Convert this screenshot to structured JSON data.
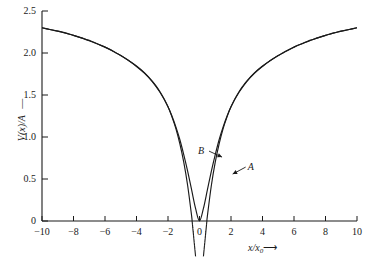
{
  "chart_data": {
    "type": "line",
    "title": "",
    "subtitle": "",
    "xlabel": "x/x0",
    "xlabel_display": "x/x",
    "xlabel_sub": "0",
    "xlabel_arrow": "⟶",
    "ylabel": "V(x)/A",
    "ylabel_arrow": "↑",
    "xlim": [
      -10,
      10
    ],
    "ylim": [
      0,
      2.5
    ],
    "xticks": [
      -10,
      -8,
      -6,
      -4,
      -2,
      0,
      2,
      4,
      6,
      8,
      10
    ],
    "xtick_labels": [
      "−10",
      "−8",
      "−6",
      "−4",
      "−2",
      "0",
      "2",
      "4",
      "6",
      "8",
      "10"
    ],
    "yticks": [
      0,
      0.5,
      1.0,
      1.5,
      2.0,
      2.5
    ],
    "ytick_labels": [
      "0",
      "0.5",
      "1.0",
      "1.5",
      "2.0",
      "2.5"
    ],
    "grid": false,
    "legend_position": "inline-annotations",
    "line_color": "#1a1a1a",
    "series": [
      {
        "name": "A",
        "label": "A",
        "style": "solid-with-dashed-extension",
        "annotation_x": 2.55,
        "annotation_y": 0.63,
        "description": "steep potential, crosses zero near x/x0 = ±1, dashed continuation below axis",
        "x": [
          -10,
          -9.5,
          -9,
          -8.5,
          -8,
          -7.5,
          -7,
          -6.5,
          -6,
          -5.5,
          -5,
          -4.5,
          -4,
          -3.5,
          -3,
          -2.5,
          -2,
          -1.75,
          -1.5,
          -1.25,
          -1,
          -0.75,
          -0.5,
          -0.25,
          0,
          0.25,
          0.5,
          0.75,
          1,
          1.25,
          1.5,
          1.75,
          2,
          2.5,
          3,
          3.5,
          4,
          4.5,
          5,
          5.5,
          6,
          6.5,
          7,
          7.5,
          8,
          8.5,
          9,
          9.5,
          10
        ],
        "y": [
          2.3,
          2.28,
          2.26,
          2.24,
          2.21,
          2.18,
          2.15,
          2.11,
          2.07,
          2.02,
          1.97,
          1.91,
          1.84,
          1.76,
          1.66,
          1.53,
          1.36,
          1.24,
          1.1,
          0.92,
          0.7,
          0.42,
          0.06,
          -0.42,
          -0.78,
          -0.42,
          0.06,
          0.42,
          0.7,
          0.92,
          1.1,
          1.24,
          1.36,
          1.53,
          1.66,
          1.76,
          1.84,
          1.91,
          1.97,
          2.02,
          2.07,
          2.11,
          2.15,
          2.18,
          2.21,
          2.24,
          2.26,
          2.28,
          2.3
        ]
      },
      {
        "name": "B",
        "label": "B",
        "style": "solid",
        "annotation_x": 1.05,
        "annotation_y": 0.82,
        "description": "smooth potential with rounded minimum touching zero at x/x0 = 0",
        "x": [
          -10,
          -9.5,
          -9,
          -8.5,
          -8,
          -7.5,
          -7,
          -6.5,
          -6,
          -5.5,
          -5,
          -4.5,
          -4,
          -3.5,
          -3,
          -2.75,
          -2.5,
          -2.25,
          -2,
          -1.75,
          -1.5,
          -1.25,
          -1,
          -0.75,
          -0.5,
          -0.25,
          0,
          0.25,
          0.5,
          0.75,
          1,
          1.25,
          1.5,
          1.75,
          2,
          2.25,
          2.5,
          2.75,
          3,
          3.5,
          4,
          4.5,
          5,
          5.5,
          6,
          6.5,
          7,
          7.5,
          8,
          8.5,
          9,
          9.5,
          10
        ],
        "y": [
          2.3,
          2.28,
          2.26,
          2.235,
          2.21,
          2.18,
          2.145,
          2.11,
          2.07,
          2.025,
          1.97,
          1.91,
          1.845,
          1.765,
          1.665,
          1.605,
          1.535,
          1.455,
          1.36,
          1.25,
          1.12,
          0.97,
          0.79,
          0.59,
          0.37,
          0.15,
          0.0,
          0.15,
          0.37,
          0.59,
          0.79,
          0.97,
          1.12,
          1.25,
          1.36,
          1.455,
          1.535,
          1.605,
          1.665,
          1.765,
          1.845,
          1.91,
          1.97,
          2.025,
          2.07,
          2.11,
          2.145,
          2.18,
          2.21,
          2.235,
          2.26,
          2.28,
          2.3
        ]
      }
    ],
    "annotations": [
      {
        "text": "A",
        "target_series": "A"
      },
      {
        "text": "B",
        "target_series": "B"
      }
    ]
  }
}
